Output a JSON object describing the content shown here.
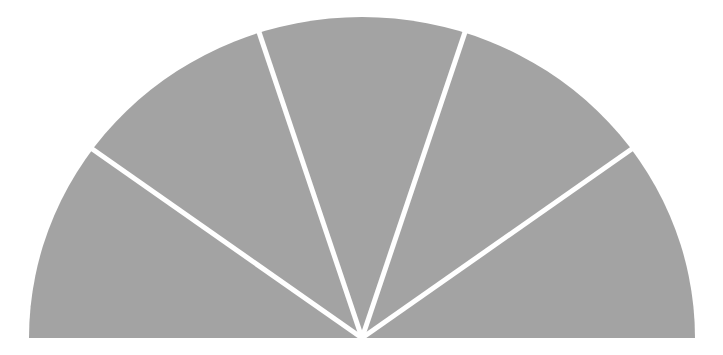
{
  "diagram": {
    "type": "semicircle-fan",
    "wedge_count": 5,
    "colors": {
      "background": "#ffffff",
      "fill": "#a3a3a3",
      "divider": "#ffffff"
    },
    "geometry": {
      "center_x": 362,
      "center_y": 338,
      "radius_x": 333,
      "radius_y": 321,
      "divider_width": 5,
      "divider_angles_deg": [
        36,
        72,
        108,
        144
      ]
    },
    "labels": []
  }
}
